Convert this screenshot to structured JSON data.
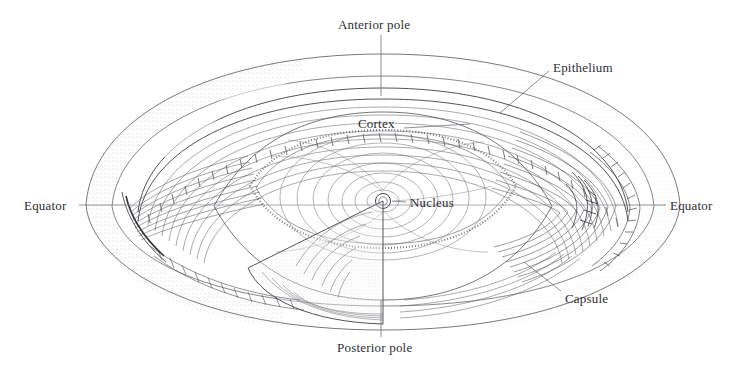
{
  "figure": {
    "background_color": "#ffffff",
    "ink_color": "#2e2e33",
    "line_color": "#55555c",
    "stipple_color": "#8a8a90",
    "width": 734,
    "height": 369
  },
  "labels": [
    {
      "id": "anterior-pole",
      "text": "Anterior pole",
      "x": 338,
      "y": 18,
      "leader": {
        "x1": 381,
        "y1": 35,
        "x2": 381,
        "y2": 96
      }
    },
    {
      "id": "epithelium",
      "text": "Epithelium",
      "x": 553,
      "y": 61,
      "leader": {
        "x1": 549,
        "y1": 71,
        "x2": 500,
        "y2": 113
      }
    },
    {
      "id": "cortex",
      "text": "Cortex",
      "x": 358,
      "y": 117,
      "leader": {
        "x1": 404,
        "y1": 128,
        "x2": 470,
        "y2": 124
      }
    },
    {
      "id": "equator-left",
      "text": "Equator",
      "x": 24,
      "y": 199,
      "leader": {
        "x1": 79,
        "y1": 205,
        "x2": 131,
        "y2": 205
      }
    },
    {
      "id": "equator-right",
      "text": "Equator",
      "x": 670,
      "y": 199,
      "leader": {
        "x1": 614,
        "y1": 205,
        "x2": 666,
        "y2": 205
      }
    },
    {
      "id": "nucleus",
      "text": "Nucleus",
      "x": 410,
      "y": 196,
      "leader": {
        "x1": 406,
        "y1": 202,
        "x2": 388,
        "y2": 201
      }
    },
    {
      "id": "capsule",
      "text": "Capsule",
      "x": 565,
      "y": 292,
      "leader": {
        "x1": 561,
        "y1": 291,
        "x2": 524,
        "y2": 262
      }
    },
    {
      "id": "posterior-pole",
      "text": "Posterior pole",
      "x": 337,
      "y": 341,
      "leader": {
        "x1": 381,
        "y1": 337,
        "x2": 381,
        "y2": 300
      }
    }
  ],
  "structures": {
    "capsule_outer": "outer ellipsoid envelope of the lens",
    "epithelium_band": "single row of cuboidal epithelial cells beneath the anterior capsule",
    "cortex_fibers": "concentric lamellar lens fibers forming the cortex",
    "nucleus_core": "small central nucleus",
    "cutaway_wedge": "pie-slice sector removed to reveal internal fiber lamellae",
    "equatorial_axis": "horizontal axis line through both equators"
  }
}
